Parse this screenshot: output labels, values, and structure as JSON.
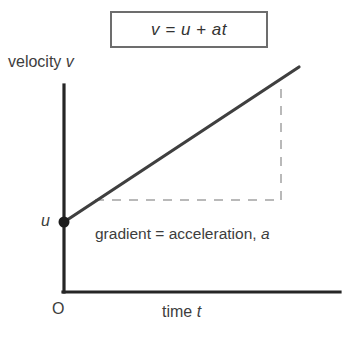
{
  "figure": {
    "kind": "velocity-time-graph",
    "equation_box": {
      "text": "v = u + at"
    },
    "axes": {
      "y_label": "velocity v",
      "x_label": "time t",
      "origin_label": "O",
      "intercept_label": "u"
    },
    "annotation": {
      "gradient_text": "gradient = acceleration, a"
    },
    "colors": {
      "line": "#3f3f3f",
      "axis": "#262626",
      "dashed": "#b9b9b9",
      "box_border": "#6d6d6d",
      "text": "#3d3d3d",
      "background": "#ffffff"
    }
  },
  "chart_data": {
    "type": "line",
    "title": "v = u + at",
    "xlabel": "time t",
    "ylabel": "velocity v",
    "grid": false,
    "legend": null,
    "xlim": [
      0,
      1
    ],
    "ylim": [
      0,
      1
    ],
    "series": [
      {
        "name": "velocity",
        "x": [
          0,
          1
        ],
        "y": [
          0.25,
          0.8
        ],
        "style": "solid",
        "note": "straight line of constant gradient a, starting at initial velocity u"
      }
    ],
    "annotations": [
      {
        "label": "u",
        "type": "y-intercept",
        "x": 0,
        "y": 0.25
      },
      {
        "label": "O",
        "type": "origin",
        "x": 0,
        "y": 0
      },
      {
        "label": "gradient = acceleration, a",
        "type": "text",
        "x": 0.15,
        "y": 0.2
      }
    ],
    "construction_lines": [
      {
        "type": "dashed-horizontal",
        "from": [
          0.13,
          0.32
        ],
        "to": [
          0.93,
          0.32
        ]
      },
      {
        "type": "dashed-vertical",
        "from": [
          0.93,
          0.32
        ],
        "to": [
          0.93,
          0.78
        ]
      }
    ]
  }
}
